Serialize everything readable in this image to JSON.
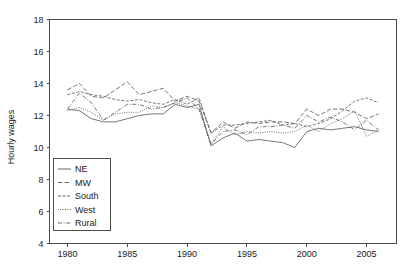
{
  "chart_data": {
    "type": "line",
    "title": "",
    "subtitle": "",
    "xlabel": "",
    "ylabel": "Hourly wages",
    "xlim": [
      1978.5,
      2007.5
    ],
    "ylim": [
      4,
      18
    ],
    "grid": false,
    "legend_position": "inside-bottom-left",
    "xticks": [
      1980,
      1985,
      1990,
      1995,
      2000,
      2005
    ],
    "yticks": [
      4,
      6,
      8,
      10,
      12,
      14,
      16,
      18
    ],
    "xtick_labels": [
      "1980",
      "1985",
      "1990",
      "1995",
      "2000",
      "2005"
    ],
    "ytick_labels": [
      "4",
      "6",
      "8",
      "10",
      "12",
      "14",
      "16",
      "18"
    ],
    "x": [
      1980,
      1981,
      1982,
      1983,
      1984,
      1985,
      1986,
      1987,
      1988,
      1989,
      1990,
      1991,
      1992,
      1993,
      1994,
      1995,
      1996,
      1997,
      1998,
      1999,
      2000,
      2001,
      2002,
      2003,
      2004,
      2005,
      2006
    ],
    "series": [
      {
        "name": "NE",
        "style": "solid",
        "values": [
          12.4,
          12.3,
          11.8,
          11.6,
          11.6,
          11.8,
          12.0,
          12.1,
          12.1,
          12.7,
          12.5,
          12.7,
          10.1,
          10.6,
          10.9,
          10.4,
          10.5,
          10.4,
          10.3,
          10.0,
          11.0,
          11.2,
          11.1,
          11.2,
          11.3,
          11.1,
          11.0
        ]
      },
      {
        "name": "MW",
        "style": "dashed",
        "values": [
          13.6,
          14.0,
          13.2,
          13.1,
          13.6,
          14.1,
          13.3,
          13.5,
          13.7,
          12.9,
          13.2,
          12.9,
          10.9,
          11.6,
          11.2,
          11.6,
          11.5,
          11.6,
          11.6,
          11.5,
          12.4,
          12.0,
          12.4,
          12.4,
          12.2,
          11.8,
          12.1
        ]
      },
      {
        "name": "South",
        "style": "dash-fine",
        "values": [
          13.3,
          13.5,
          13.3,
          13.2,
          13.0,
          12.9,
          13.0,
          12.8,
          12.7,
          13.0,
          12.7,
          13.1,
          10.9,
          11.4,
          11.4,
          11.5,
          11.6,
          11.7,
          11.4,
          11.5,
          11.3,
          11.5,
          11.8,
          12.3,
          12.9,
          13.1,
          12.8
        ]
      },
      {
        "name": "West",
        "style": "dotted",
        "values": [
          12.3,
          12.5,
          12.2,
          11.7,
          12.1,
          12.2,
          12.2,
          12.6,
          12.5,
          12.8,
          12.6,
          12.4,
          10.2,
          11.3,
          10.8,
          11.0,
          10.9,
          11.0,
          10.9,
          11.0,
          11.4,
          11.0,
          11.5,
          11.8,
          12.3,
          10.7,
          11.1
        ]
      },
      {
        "name": "Rural",
        "style": "dash-dot",
        "values": [
          12.4,
          13.4,
          12.8,
          11.7,
          12.2,
          12.7,
          12.7,
          12.4,
          12.5,
          12.8,
          13.1,
          12.4,
          10.2,
          11.0,
          11.1,
          10.8,
          11.3,
          11.3,
          11.4,
          11.2,
          12.0,
          11.6,
          11.9,
          11.6,
          11.1,
          11.7,
          11.1
        ]
      }
    ],
    "legend_entries": [
      "NE",
      "MW",
      "South",
      "West",
      "Rural"
    ]
  },
  "colors": {
    "line": "#555555",
    "axis": "#4d4d4d",
    "text": "#1a1a1a",
    "background": "#ffffff"
  }
}
